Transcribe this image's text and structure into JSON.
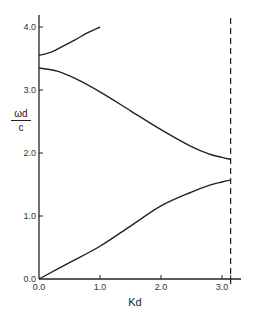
{
  "chart_data": {
    "type": "line",
    "title": "",
    "xlabel": "Kd",
    "ylabel": "ωd/c",
    "ylabel_parts": {
      "numerator": "ωd",
      "denominator": "c"
    },
    "xlim": [
      0.0,
      3.3
    ],
    "ylim": [
      0.0,
      4.15
    ],
    "xticks": [
      0.0,
      1.0,
      2.0,
      3.0
    ],
    "xtick_labels": [
      "0.0",
      "1.0",
      "2.0",
      "3.0"
    ],
    "yticks": [
      0.0,
      1.0,
      2.0,
      3.0,
      4.0
    ],
    "ytick_labels": [
      "0.0",
      "1.0",
      "2.0",
      "3.0",
      "4.0"
    ],
    "grid": false,
    "legend": null,
    "vertical_line": {
      "x": 3.14159,
      "style": "dashed",
      "label": "Kd = π (Brillouin zone edge)"
    },
    "series": [
      {
        "name": "lower band",
        "x": [
          0.0,
          0.5,
          1.0,
          1.5,
          2.0,
          2.5,
          2.8,
          3.0,
          3.14
        ],
        "y": [
          0.0,
          0.26,
          0.52,
          0.84,
          1.16,
          1.38,
          1.49,
          1.54,
          1.57
        ]
      },
      {
        "name": "middle band",
        "x": [
          0.0,
          0.3,
          0.6,
          1.0,
          1.5,
          2.0,
          2.5,
          2.8,
          3.0,
          3.14
        ],
        "y": [
          3.35,
          3.3,
          3.18,
          2.97,
          2.67,
          2.37,
          2.1,
          1.98,
          1.93,
          1.9
        ]
      },
      {
        "name": "upper band",
        "x": [
          0.0,
          0.2,
          0.4,
          0.6,
          0.8,
          1.0
        ],
        "y": [
          3.55,
          3.6,
          3.7,
          3.8,
          3.91,
          4.0
        ]
      }
    ]
  }
}
